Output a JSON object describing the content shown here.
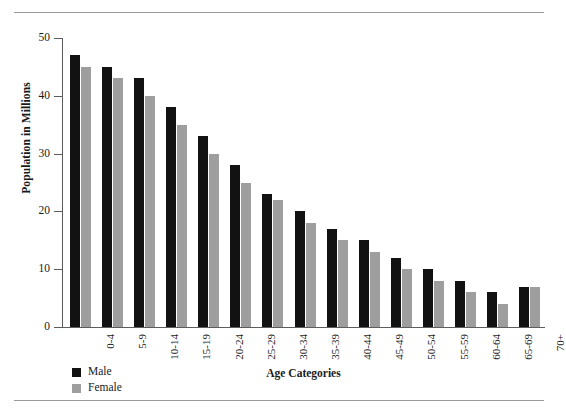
{
  "chart_data": {
    "type": "bar",
    "title": "",
    "xlabel": "Age Categories",
    "ylabel": "Population in Millions",
    "categories": [
      "0-4",
      "5-9",
      "10-14",
      "15-19",
      "20-24",
      "25-29",
      "30-34",
      "35-39",
      "40-44",
      "45-49",
      "50-54",
      "55-59",
      "60-64",
      "65-69",
      "70+"
    ],
    "series": [
      {
        "name": "Male",
        "color": "#121212",
        "values": [
          47,
          45,
          43,
          38,
          33,
          28,
          23,
          20,
          17,
          15,
          12,
          10,
          8,
          6,
          7
        ]
      },
      {
        "name": "Female",
        "color": "#9e9e9e",
        "values": [
          45,
          43,
          40,
          35,
          30,
          25,
          22,
          18,
          15,
          13,
          10,
          8,
          6,
          4,
          7
        ]
      }
    ],
    "ylim": [
      0,
      50
    ],
    "yticks": [
      0,
      10,
      20,
      30,
      40,
      50
    ],
    "ytick_labels": [
      "0",
      "10",
      "20",
      "30",
      "40",
      "50"
    ],
    "grid": false,
    "legend_position": "bottom-left",
    "orientation": "vertical",
    "bar_mode": "grouped"
  },
  "legend": {
    "items": [
      {
        "label": "Male"
      },
      {
        "label": "Female"
      }
    ]
  },
  "figure": {
    "top_rule": "horizontal-rule",
    "bottom_rule": "horizontal-rule"
  }
}
